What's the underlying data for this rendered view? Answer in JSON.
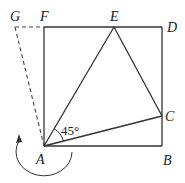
{
  "figure": {
    "points": {
      "A": "A",
      "B": "B",
      "C": "C",
      "D": "D",
      "E": "E",
      "F": "F",
      "G": "G"
    },
    "angle_label": "45°",
    "rotation_indicator": "counterclockwise-arrow"
  }
}
